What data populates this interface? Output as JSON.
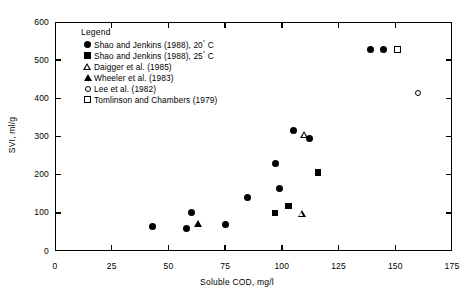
{
  "chart_data": {
    "type": "scatter",
    "title": "",
    "xlabel": "Soluble COD, mg/l",
    "ylabel": "SVI, ml/g",
    "xlim": [
      0,
      175
    ],
    "ylim": [
      0,
      600
    ],
    "xticks": [
      0,
      25,
      50,
      75,
      100,
      125,
      150,
      175
    ],
    "yticks": [
      0,
      100,
      200,
      300,
      400,
      500,
      600
    ],
    "grid": false,
    "legend_title": "Legend",
    "legend_position": "upper-left-inside",
    "series": [
      {
        "name": "Shao and Jenkins (1988), 20° C",
        "marker": "filled-circle",
        "points": [
          {
            "x": 43,
            "y": 65
          },
          {
            "x": 58,
            "y": 60
          },
          {
            "x": 60,
            "y": 102
          },
          {
            "x": 75,
            "y": 70
          },
          {
            "x": 85,
            "y": 141
          },
          {
            "x": 99,
            "y": 165
          },
          {
            "x": 97,
            "y": 228
          },
          {
            "x": 105,
            "y": 317
          },
          {
            "x": 112,
            "y": 296
          },
          {
            "x": 139,
            "y": 527
          },
          {
            "x": 145,
            "y": 527
          }
        ]
      },
      {
        "name": "Shao and Jenkins (1988), 25° C",
        "marker": "filled-square",
        "points": [
          {
            "x": 97,
            "y": 100
          },
          {
            "x": 103,
            "y": 118
          },
          {
            "x": 116,
            "y": 206
          }
        ]
      },
      {
        "name": "Daigger et al. (1985)",
        "marker": "open-triangle",
        "points": [
          {
            "x": 109,
            "y": 97
          },
          {
            "x": 110,
            "y": 304
          }
        ]
      },
      {
        "name": "Wheeler et al. (1983)",
        "marker": "filled-triangle",
        "points": [
          {
            "x": 63,
            "y": 71
          }
        ]
      },
      {
        "name": "Lee et al. (1982)",
        "marker": "open-circle",
        "points": [
          {
            "x": 160,
            "y": 413
          }
        ]
      },
      {
        "name": "Tomlinson and Chambers (1979)",
        "marker": "open-square",
        "points": [
          {
            "x": 151,
            "y": 527
          }
        ]
      }
    ]
  }
}
